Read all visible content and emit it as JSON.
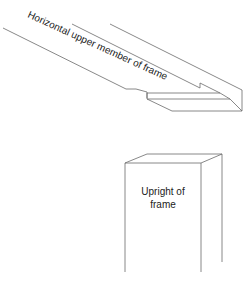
{
  "diagram": {
    "labels": {
      "horizontal_member": "Horizontal upper member of frame",
      "upright_line1": "Upright of",
      "upright_line2": "frame"
    },
    "colors": {
      "line": "#6a6a6a",
      "text": "#222222",
      "background": "#ffffff"
    }
  }
}
